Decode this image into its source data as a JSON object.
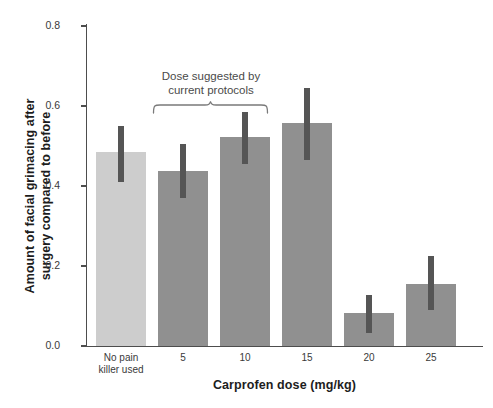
{
  "chart_data": {
    "type": "bar",
    "title": "",
    "xlabel": "Carprofen dose (mg/kg)",
    "ylabel": "Amount of facial grimacing after surgery compared to before",
    "ylabel_line1": "Amount of facial grimacing after",
    "ylabel_line2": "surgery compared to before",
    "categories": [
      "No pain killer used",
      "5",
      "10",
      "15",
      "20",
      "25"
    ],
    "category_labels": [
      {
        "line1": "No pain",
        "line2": "killer used"
      },
      {
        "line1": "5",
        "line2": ""
      },
      {
        "line1": "10",
        "line2": ""
      },
      {
        "line1": "15",
        "line2": ""
      },
      {
        "line1": "20",
        "line2": ""
      },
      {
        "line1": "25",
        "line2": ""
      }
    ],
    "values": [
      0.485,
      0.437,
      0.522,
      0.558,
      0.083,
      0.155
    ],
    "error_upper": [
      0.55,
      0.505,
      0.585,
      0.645,
      0.128,
      0.225
    ],
    "error_lower": [
      0.41,
      0.37,
      0.455,
      0.465,
      0.032,
      0.09
    ],
    "bar_colors": [
      "#cdcdcd",
      "#909090",
      "#909090",
      "#909090",
      "#909090",
      "#909090"
    ],
    "error_color": "#555555",
    "ylim": [
      0.0,
      0.8
    ],
    "yticks": [
      "0.0",
      "0.2",
      "0.4",
      "0.6",
      "0.8"
    ],
    "ytick_values": [
      0.0,
      0.2,
      0.4,
      0.6,
      0.8
    ],
    "grid": false,
    "legend": null,
    "annotations": [
      {
        "text_line1": "Dose suggested by",
        "text_line2": "current protocols",
        "spans_categories": [
          "5",
          "10",
          "15"
        ]
      }
    ]
  }
}
